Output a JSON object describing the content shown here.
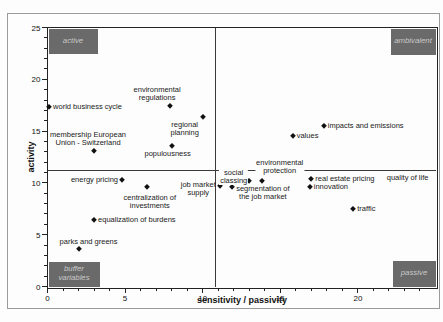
{
  "figure": {
    "background": "#fdfdfd",
    "frame_color": "#9a9a9a",
    "axis_color": "#222222",
    "marker_color": "#111111",
    "quadrant_box_color": "#6a6a6a",
    "quadrant_box_text_color": "#c9c9c9"
  },
  "chart_data": {
    "type": "scatter",
    "title": "",
    "xlabel": "sensitivity / passivity",
    "ylabel": "activity",
    "xlim": [
      0,
      25
    ],
    "ylim": [
      0,
      25
    ],
    "grid": false,
    "legend": null,
    "x_major_ticks": [
      0,
      5,
      10,
      15,
      20
    ],
    "y_major_ticks": [
      0,
      5,
      10,
      15,
      20,
      25
    ],
    "minor_tick_step": 1,
    "quadrant_divider": {
      "x": 10.8,
      "y": 11.2
    },
    "quadrant_labels": [
      {
        "text": "active",
        "corner": "top-left"
      },
      {
        "text": "ambivalent",
        "corner": "top-right"
      },
      {
        "text": "buffer variables",
        "corner": "bottom-left"
      },
      {
        "text": "passive",
        "corner": "bottom-right"
      }
    ],
    "points": [
      {
        "label_lines": [
          "world business cycle"
        ],
        "x": 0.1,
        "y": 17.3,
        "anchor": "right"
      },
      {
        "label_lines": [
          "membership European",
          "Union - Switzerland"
        ],
        "x": 3.0,
        "y": 13.1,
        "anchor": "above",
        "dx": -6
      },
      {
        "label_lines": [
          "environmental",
          "regulations"
        ],
        "x": 7.9,
        "y": 17.4,
        "anchor": "above",
        "dx": -13
      },
      {
        "label_lines": [
          "regional",
          "planning"
        ],
        "x": 10.0,
        "y": 16.4,
        "anchor": "below",
        "dx": -18
      },
      {
        "label_lines": [
          "populousness"
        ],
        "x": 8.0,
        "y": 13.6,
        "anchor": "below",
        "dx": -4
      },
      {
        "label_lines": [
          "values"
        ],
        "x": 15.8,
        "y": 14.5,
        "anchor": "right"
      },
      {
        "label_lines": [
          "impacts and emissions"
        ],
        "x": 17.8,
        "y": 15.5,
        "anchor": "right"
      },
      {
        "label_lines": [
          "energy pricing"
        ],
        "x": 4.8,
        "y": 10.3,
        "anchor": "left"
      },
      {
        "label_lines": [
          "centralization of",
          "investments"
        ],
        "x": 6.4,
        "y": 9.6,
        "anchor": "below",
        "dx": 3,
        "dy": 3
      },
      {
        "label_lines": [
          "equalization of burdens"
        ],
        "x": 3.0,
        "y": 6.4,
        "anchor": "right"
      },
      {
        "label_lines": [
          "parks and greens"
        ],
        "x": 2.0,
        "y": 3.6,
        "anchor": "above",
        "dx": 10,
        "dy": 1
      },
      {
        "label_lines": [
          "job market",
          "supply"
        ],
        "x": 11.1,
        "y": 9.7,
        "anchor": "left",
        "dy": 3,
        "align": "center"
      },
      {
        "label_lines": [
          "segmentation of",
          "the job market"
        ],
        "x": 11.9,
        "y": 9.6,
        "anchor": "right",
        "dy": 6,
        "align": "center"
      },
      {
        "label_lines": [
          "social",
          "classing"
        ],
        "x": 13.0,
        "y": 10.2,
        "anchor": "left",
        "dx": 3,
        "dy": -4,
        "align": "center",
        "bg": true
      },
      {
        "label_lines": [
          "environmental",
          "protection"
        ],
        "x": 13.8,
        "y": 10.2,
        "anchor": "above",
        "dx": 18,
        "dy": -2,
        "bg": true
      },
      {
        "label_lines": [
          "real estate pricing"
        ],
        "x": 17.0,
        "y": 10.4,
        "anchor": "right"
      },
      {
        "label_lines": [
          "innovation"
        ],
        "x": 16.9,
        "y": 9.6,
        "anchor": "right"
      },
      {
        "label_lines": [
          "traffic"
        ],
        "x": 19.7,
        "y": 7.5,
        "anchor": "right"
      },
      {
        "label_lines": [
          "quality of life"
        ],
        "x": 23.2,
        "y": 10.5,
        "anchor": "center",
        "marker": false
      }
    ]
  }
}
